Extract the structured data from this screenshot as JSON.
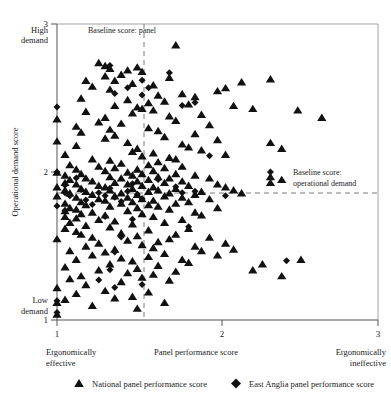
{
  "chart_data": {
    "type": "scatter",
    "title": "",
    "xlabel": "Panel performance score",
    "ylabel": "Operational demand score",
    "xlim": [
      1,
      3
    ],
    "ylim": [
      1,
      3
    ],
    "xticks": [
      1,
      2,
      3
    ],
    "yticks": [
      1,
      2,
      3
    ],
    "xtick_labels": [
      "1",
      "2",
      "3"
    ],
    "ytick_labels": [
      "1",
      "2",
      "3"
    ],
    "grid": false,
    "legend_position": "bottom",
    "axis_corner_labels": {
      "y_top": "High\ndemand",
      "y_top_line1": "High",
      "y_top_line2": "demand",
      "y_bottom_line1": "Low",
      "y_bottom_line2": "demand",
      "x_left_line1": "Ergonomically",
      "x_left_line2": "effective",
      "x_right_line1": "Ergonomically",
      "x_right_line2": "ineffective"
    },
    "annotations": [
      {
        "name": "baseline-panel",
        "text_line1": "Baseline score:",
        "text_line2": "panel",
        "text_inline": "Baseline score: panel",
        "type": "vertical-dashed-line",
        "value": 1.53
      },
      {
        "name": "baseline-operational-demand",
        "text_line1": "Baseline score:",
        "text_line2": "operational demand",
        "type": "horizontal-dashed-line",
        "value": 1.8
      }
    ],
    "series": [
      {
        "name": "National panel performance score",
        "marker": "triangle",
        "color": "#111111",
        "points": [
          [
            1.0,
            2.36
          ],
          [
            1.0,
            2.21
          ],
          [
            1.0,
            2.0
          ],
          [
            1.0,
            1.9
          ],
          [
            1.0,
            1.84
          ],
          [
            1.0,
            1.55
          ],
          [
            1.0,
            1.22
          ],
          [
            1.0,
            1.12
          ],
          [
            1.0,
            1.04
          ],
          [
            1.05,
            2.12
          ],
          [
            1.05,
            1.98
          ],
          [
            1.05,
            1.93
          ],
          [
            1.05,
            1.88
          ],
          [
            1.05,
            1.79
          ],
          [
            1.05,
            1.74
          ],
          [
            1.05,
            1.7
          ],
          [
            1.05,
            1.62
          ],
          [
            1.05,
            1.36
          ],
          [
            1.05,
            1.14
          ],
          [
            1.08,
            2.05
          ],
          [
            1.08,
            1.95
          ],
          [
            1.08,
            1.86
          ],
          [
            1.08,
            1.76
          ],
          [
            1.08,
            1.66
          ],
          [
            1.08,
            1.47
          ],
          [
            1.08,
            1.28
          ],
          [
            1.12,
            2.31
          ],
          [
            1.12,
            2.18
          ],
          [
            1.12,
            2.02
          ],
          [
            1.12,
            1.92
          ],
          [
            1.12,
            1.83
          ],
          [
            1.12,
            1.75
          ],
          [
            1.12,
            1.69
          ],
          [
            1.12,
            1.6
          ],
          [
            1.12,
            1.41
          ],
          [
            1.12,
            1.18
          ],
          [
            1.15,
            2.5
          ],
          [
            1.15,
            2.27
          ],
          [
            1.15,
            1.99
          ],
          [
            1.15,
            1.89
          ],
          [
            1.15,
            1.8
          ],
          [
            1.15,
            1.72
          ],
          [
            1.15,
            1.58
          ],
          [
            1.15,
            1.3
          ],
          [
            1.18,
            2.62
          ],
          [
            1.18,
            2.41
          ],
          [
            1.18,
            1.96
          ],
          [
            1.18,
            1.87
          ],
          [
            1.18,
            1.78
          ],
          [
            1.18,
            1.64
          ],
          [
            1.18,
            1.5
          ],
          [
            1.18,
            1.24
          ],
          [
            1.22,
            2.58
          ],
          [
            1.22,
            2.09
          ],
          [
            1.22,
            1.94
          ],
          [
            1.22,
            1.85
          ],
          [
            1.22,
            1.73
          ],
          [
            1.22,
            1.56
          ],
          [
            1.22,
            1.44
          ],
          [
            1.22,
            1.1
          ],
          [
            1.26,
            2.74
          ],
          [
            1.26,
            2.34
          ],
          [
            1.26,
            2.04
          ],
          [
            1.26,
            1.91
          ],
          [
            1.26,
            1.82
          ],
          [
            1.26,
            1.68
          ],
          [
            1.26,
            1.52
          ],
          [
            1.26,
            1.34
          ],
          [
            1.3,
            2.72
          ],
          [
            1.3,
            2.65
          ],
          [
            1.3,
            2.37
          ],
          [
            1.3,
            2.23
          ],
          [
            1.3,
            2.01
          ],
          [
            1.3,
            1.9
          ],
          [
            1.3,
            1.81
          ],
          [
            1.3,
            1.71
          ],
          [
            1.3,
            1.46
          ],
          [
            1.3,
            1.2
          ],
          [
            1.33,
            2.7
          ],
          [
            1.33,
            2.56
          ],
          [
            1.33,
            2.29
          ],
          [
            1.33,
            2.08
          ],
          [
            1.33,
            1.97
          ],
          [
            1.33,
            1.88
          ],
          [
            1.33,
            1.77
          ],
          [
            1.33,
            1.63
          ],
          [
            1.33,
            1.38
          ],
          [
            1.36,
            2.62
          ],
          [
            1.36,
            2.45
          ],
          [
            1.36,
            2.25
          ],
          [
            1.36,
            2.03
          ],
          [
            1.36,
            1.93
          ],
          [
            1.36,
            1.84
          ],
          [
            1.36,
            1.67
          ],
          [
            1.36,
            1.48
          ],
          [
            1.36,
            1.15
          ],
          [
            1.4,
            2.66
          ],
          [
            1.4,
            2.33
          ],
          [
            1.4,
            2.06
          ],
          [
            1.4,
            1.96
          ],
          [
            1.4,
            1.86
          ],
          [
            1.4,
            1.79
          ],
          [
            1.4,
            1.59
          ],
          [
            1.4,
            1.42
          ],
          [
            1.4,
            1.26
          ],
          [
            1.44,
            2.69
          ],
          [
            1.44,
            2.49
          ],
          [
            1.44,
            2.2
          ],
          [
            1.44,
            2.0
          ],
          [
            1.44,
            1.92
          ],
          [
            1.44,
            1.83
          ],
          [
            1.44,
            1.74
          ],
          [
            1.44,
            1.54
          ],
          [
            1.44,
            1.32
          ],
          [
            1.47,
            2.6
          ],
          [
            1.47,
            2.4
          ],
          [
            1.47,
            2.14
          ],
          [
            1.47,
            1.98
          ],
          [
            1.47,
            1.89
          ],
          [
            1.47,
            1.8
          ],
          [
            1.47,
            1.65
          ],
          [
            1.47,
            1.4
          ],
          [
            1.47,
            1.16
          ],
          [
            1.5,
            2.71
          ],
          [
            1.5,
            2.44
          ],
          [
            1.5,
            2.16
          ],
          [
            1.5,
            2.02
          ],
          [
            1.5,
            1.94
          ],
          [
            1.5,
            1.85
          ],
          [
            1.5,
            1.76
          ],
          [
            1.5,
            1.57
          ],
          [
            1.5,
            1.35
          ],
          [
            1.5,
            1.08
          ],
          [
            1.53,
            2.68
          ],
          [
            1.53,
            2.43
          ],
          [
            1.53,
            2.11
          ],
          [
            1.53,
            1.99
          ],
          [
            1.53,
            1.91
          ],
          [
            1.53,
            1.82
          ],
          [
            1.53,
            1.72
          ],
          [
            1.53,
            1.51
          ],
          [
            1.53,
            1.29
          ],
          [
            1.57,
            2.47
          ],
          [
            1.57,
            2.3
          ],
          [
            1.57,
            2.05
          ],
          [
            1.57,
            1.95
          ],
          [
            1.57,
            1.87
          ],
          [
            1.57,
            1.78
          ],
          [
            1.57,
            1.61
          ],
          [
            1.57,
            1.43
          ],
          [
            1.57,
            1.19
          ],
          [
            1.6,
            2.59
          ],
          [
            1.6,
            2.42
          ],
          [
            1.6,
            2.13
          ],
          [
            1.6,
            2.01
          ],
          [
            1.6,
            1.9
          ],
          [
            1.6,
            1.81
          ],
          [
            1.6,
            1.7
          ],
          [
            1.6,
            1.49
          ],
          [
            1.6,
            1.31
          ],
          [
            1.63,
            2.52
          ],
          [
            1.63,
            2.28
          ],
          [
            1.63,
            2.07
          ],
          [
            1.63,
            1.97
          ],
          [
            1.63,
            1.88
          ],
          [
            1.63,
            1.77
          ],
          [
            1.63,
            1.53
          ],
          [
            1.63,
            1.37
          ],
          [
            1.67,
            2.48
          ],
          [
            1.67,
            2.24
          ],
          [
            1.67,
            2.03
          ],
          [
            1.67,
            1.93
          ],
          [
            1.67,
            1.84
          ],
          [
            1.67,
            1.66
          ],
          [
            1.67,
            1.45
          ],
          [
            1.67,
            1.12
          ],
          [
            1.7,
            2.64
          ],
          [
            1.7,
            2.38
          ],
          [
            1.7,
            2.1
          ],
          [
            1.7,
            1.96
          ],
          [
            1.7,
            1.86
          ],
          [
            1.7,
            1.75
          ],
          [
            1.7,
            1.55
          ],
          [
            1.7,
            1.27
          ],
          [
            1.74,
            2.86
          ],
          [
            1.74,
            2.35
          ],
          [
            1.74,
            2.09
          ],
          [
            1.74,
            1.99
          ],
          [
            1.74,
            1.89
          ],
          [
            1.74,
            1.79
          ],
          [
            1.74,
            1.58
          ],
          [
            1.74,
            1.33
          ],
          [
            1.78,
            2.53
          ],
          [
            1.78,
            2.19
          ],
          [
            1.78,
            2.04
          ],
          [
            1.78,
            1.94
          ],
          [
            1.78,
            1.83
          ],
          [
            1.78,
            1.68
          ],
          [
            1.78,
            1.41
          ],
          [
            1.82,
            2.46
          ],
          [
            1.82,
            2.17
          ],
          [
            1.82,
            1.91
          ],
          [
            1.82,
            1.8
          ],
          [
            1.82,
            1.62
          ],
          [
            1.82,
            1.39
          ],
          [
            1.86,
            2.51
          ],
          [
            1.86,
            2.26
          ],
          [
            1.86,
            1.98
          ],
          [
            1.86,
            1.85
          ],
          [
            1.86,
            1.73
          ],
          [
            1.86,
            1.5
          ],
          [
            1.9,
            2.39
          ],
          [
            1.9,
            2.15
          ],
          [
            1.9,
            1.87
          ],
          [
            1.9,
            1.71
          ],
          [
            1.9,
            1.47
          ],
          [
            1.95,
            2.32
          ],
          [
            1.95,
            1.96
          ],
          [
            1.95,
            1.82
          ],
          [
            1.95,
            1.56
          ],
          [
            2.0,
            2.55
          ],
          [
            2.0,
            2.22
          ],
          [
            2.0,
            1.92
          ],
          [
            2.0,
            1.76
          ],
          [
            2.0,
            1.44
          ],
          [
            2.05,
            2.57
          ],
          [
            2.05,
            2.12
          ],
          [
            2.05,
            1.9
          ],
          [
            2.05,
            1.52
          ],
          [
            2.1,
            2.45
          ],
          [
            2.1,
            1.88
          ],
          [
            2.1,
            1.48
          ],
          [
            2.15,
            2.61
          ],
          [
            2.15,
            1.86
          ],
          [
            2.22,
            2.43
          ],
          [
            2.22,
            1.34
          ],
          [
            2.28,
            1.38
          ],
          [
            2.33,
            2.63
          ],
          [
            2.33,
            2.2
          ],
          [
            2.33,
            1.97
          ],
          [
            2.33,
            1.93
          ],
          [
            2.4,
            2.16
          ],
          [
            2.4,
            1.95
          ],
          [
            2.4,
            1.3
          ],
          [
            2.5,
            2.42
          ],
          [
            2.52,
            1.41
          ],
          [
            2.65,
            2.37
          ]
        ]
      },
      {
        "name": "East Anglia panel performance score",
        "marker": "diamond",
        "color": "#111111",
        "points": [
          [
            1.0,
            2.44
          ],
          [
            1.0,
            2.0
          ],
          [
            1.0,
            1.77
          ],
          [
            1.0,
            1.13
          ],
          [
            1.0,
            1.05
          ],
          [
            1.05,
            1.91
          ],
          [
            1.05,
            1.86
          ],
          [
            1.05,
            1.74
          ],
          [
            1.08,
            1.84
          ],
          [
            1.12,
            1.96
          ],
          [
            1.15,
            1.88
          ],
          [
            1.18,
            1.81
          ],
          [
            1.22,
            1.78
          ],
          [
            1.26,
            1.86
          ],
          [
            1.26,
            1.27
          ],
          [
            1.3,
            1.84
          ],
          [
            1.3,
            1.7
          ],
          [
            1.33,
            2.72
          ],
          [
            1.33,
            1.89
          ],
          [
            1.33,
            1.34
          ],
          [
            1.36,
            2.53
          ],
          [
            1.36,
            1.83
          ],
          [
            1.36,
            1.46
          ],
          [
            1.36,
            1.22
          ],
          [
            1.4,
            1.8
          ],
          [
            1.4,
            1.56
          ],
          [
            1.44,
            2.57
          ],
          [
            1.44,
            1.87
          ],
          [
            1.47,
            1.92
          ],
          [
            1.47,
            1.68
          ],
          [
            1.5,
            1.85
          ],
          [
            1.53,
            2.62
          ],
          [
            1.53,
            2.52
          ],
          [
            1.53,
            1.82
          ],
          [
            1.53,
            1.24
          ],
          [
            1.57,
            2.57
          ],
          [
            1.63,
            1.95
          ],
          [
            1.7,
            2.67
          ],
          [
            1.74,
            1.9
          ],
          [
            1.78,
            2.45
          ],
          [
            1.78,
            1.86
          ],
          [
            1.82,
            1.63
          ],
          [
            1.86,
            2.47
          ],
          [
            1.86,
            1.87
          ],
          [
            1.95,
            2.11
          ],
          [
            2.05,
            1.84
          ],
          [
            2.33,
            2.0
          ],
          [
            2.43,
            1.4
          ]
        ]
      }
    ]
  },
  "legend": {
    "items": [
      {
        "marker": "triangle",
        "label": "National panel performance score"
      },
      {
        "marker": "diamond",
        "label": "East Anglia panel performance score"
      }
    ]
  }
}
